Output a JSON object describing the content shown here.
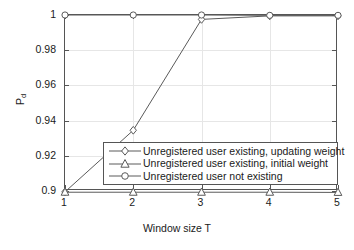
{
  "chart_data": {
    "type": "line",
    "title": "",
    "xlabel": "Window size T",
    "ylabel": "P_d",
    "ylabel_base": "P",
    "ylabel_sub": "d",
    "x": [
      1,
      2,
      3,
      4,
      5
    ],
    "xticklabels": [
      "1",
      "2",
      "3",
      "4",
      "5"
    ],
    "yticks": [
      0.9,
      0.92,
      0.94,
      0.96,
      0.98,
      1
    ],
    "yticklabels": [
      "0.9",
      "0.92",
      "0.94",
      "0.96",
      "0.98",
      "1"
    ],
    "xlim": [
      1,
      5
    ],
    "ylim": [
      0.9,
      1.0
    ],
    "grid": true,
    "legend_position": "center",
    "series": [
      {
        "name": "Unregistered user existing, updating weight",
        "marker": "diamond",
        "color": "#5a5a5a",
        "values": [
          0.8995,
          0.9345,
          0.9975,
          0.9995,
          0.9995
        ]
      },
      {
        "name": "Unregistered user existing, initial weight",
        "marker": "triangle",
        "color": "#5a5a5a",
        "values": [
          0.8993,
          0.8993,
          0.8993,
          0.8993,
          0.8992
        ]
      },
      {
        "name": "Unregistered user not existing",
        "marker": "circle",
        "color": "#5a5a5a",
        "values": [
          1.0,
          1.0,
          1.0,
          0.9998,
          0.9998
        ]
      }
    ]
  },
  "legend": {
    "items": [
      {
        "label": "Unregistered user existing, updating weight",
        "marker": "diamond-marker"
      },
      {
        "label": "Unregistered user existing, initial weight",
        "marker": "triangle-marker"
      },
      {
        "label": "Unregistered user not existing",
        "marker": "circle-marker"
      }
    ]
  },
  "colors": {
    "line": "#5a5a5a",
    "axis": "#555555",
    "grid": "#e6e6e6",
    "background": "#ffffff",
    "text": "#1a1a1a"
  }
}
